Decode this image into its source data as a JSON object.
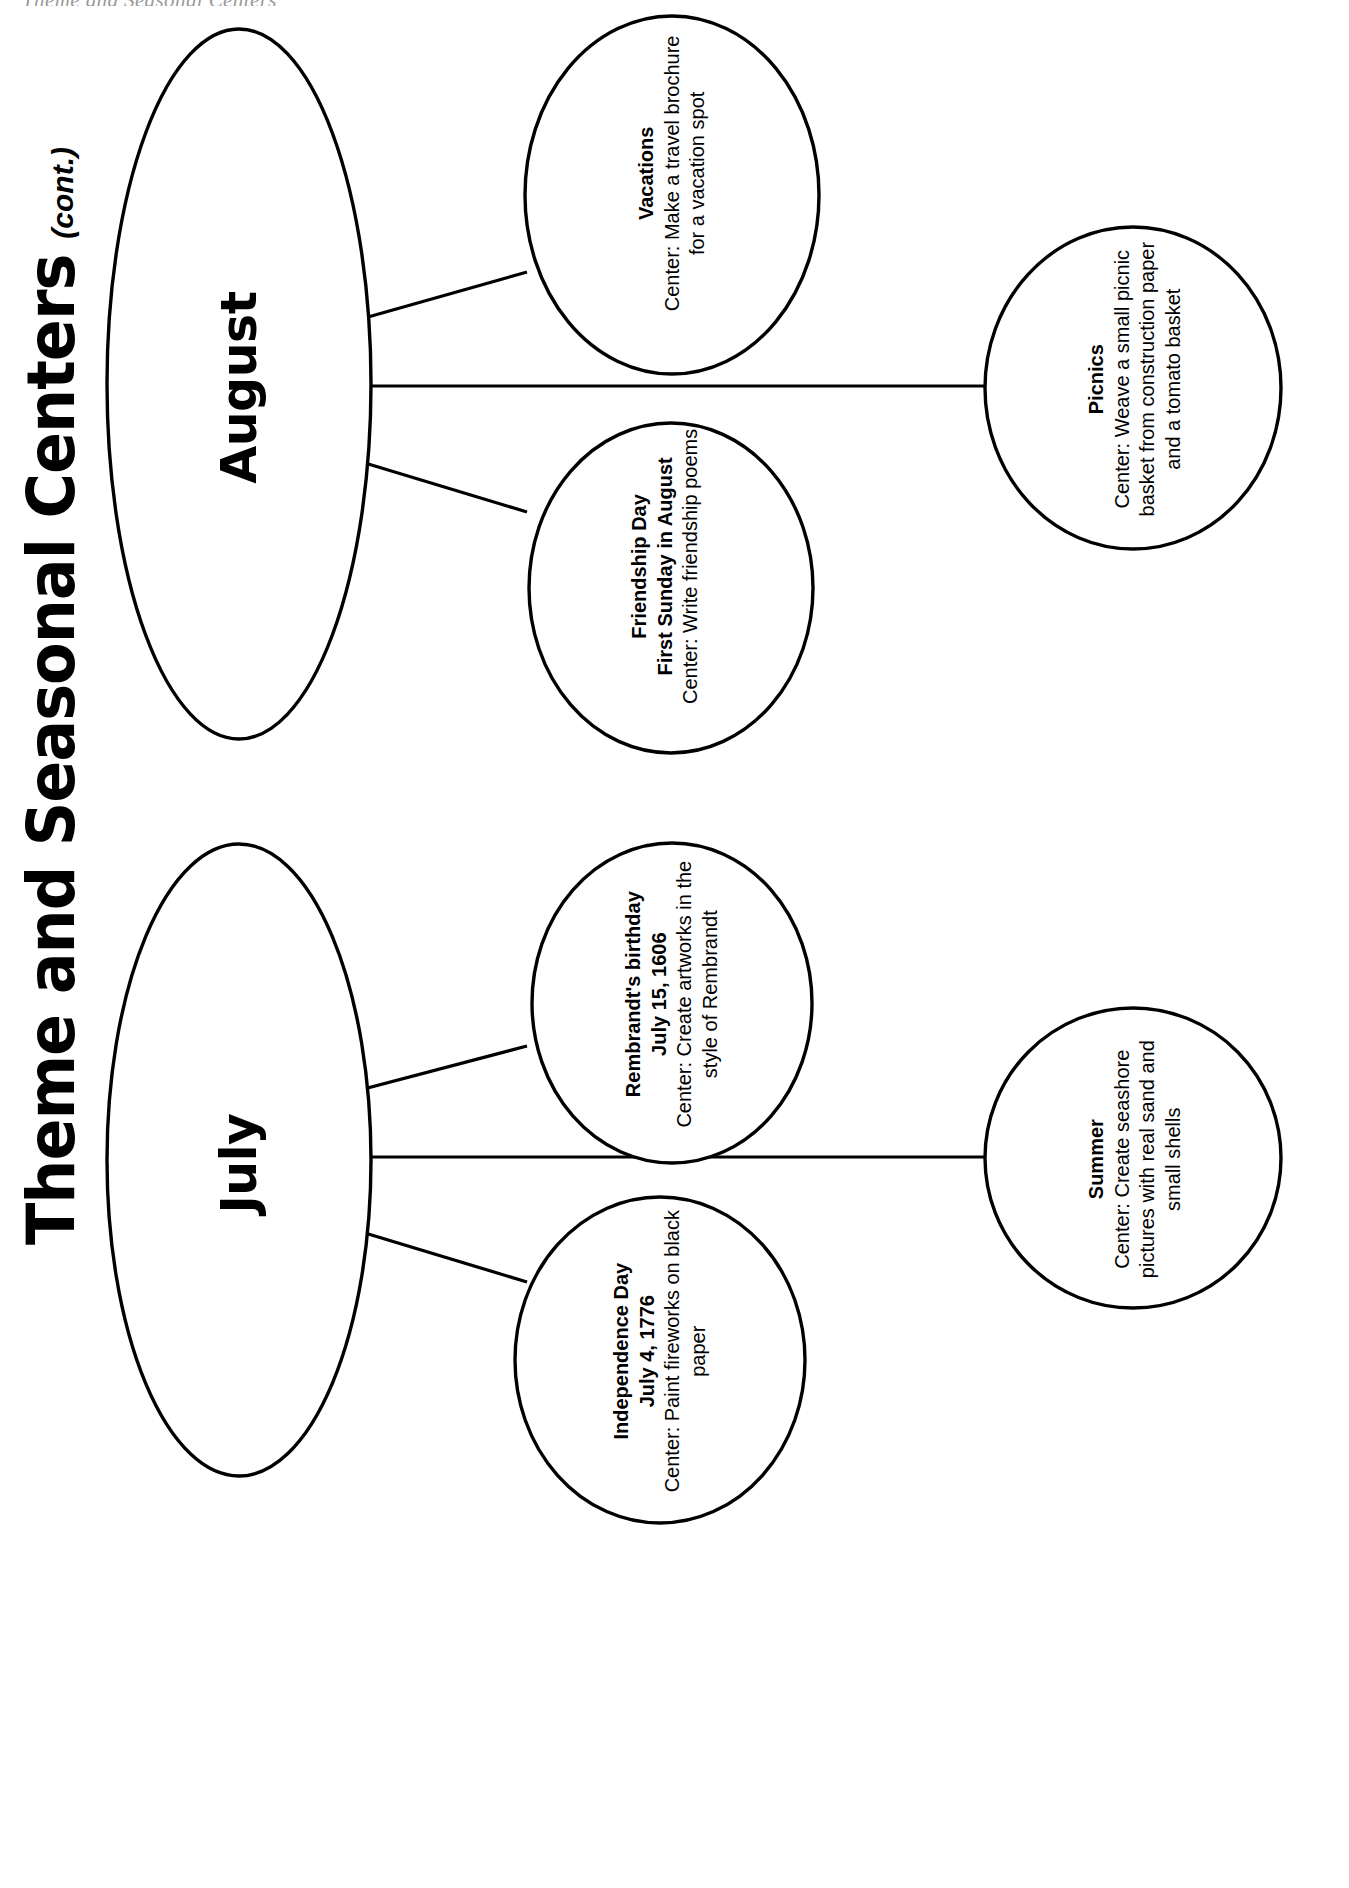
{
  "running_header": "Theme and Seasonal Centers",
  "title": {
    "main": "Theme and Seasonal Centers",
    "suffix": "(cont.)"
  },
  "diagram": {
    "type": "mind-map",
    "orientation": "rotated-90-ccw",
    "branches": [
      {
        "month": "August",
        "nodes": [
          {
            "name": "vacations",
            "title": "Vacations",
            "body": "Center: Make a travel brochure for a vacation spot"
          },
          {
            "name": "friendship-day",
            "title": "Friendship Day\nFirst Sunday in August",
            "title_line1": "Friendship Day",
            "title_line2": "First Sunday in August",
            "body": "Center: Write friendship poems"
          },
          {
            "name": "picnics",
            "title": "Picnics",
            "body": "Center: Weave a small picnic basket from construction paper and a tomato basket"
          }
        ]
      },
      {
        "month": "July",
        "nodes": [
          {
            "name": "rembrandts-birthday",
            "title": "Rembrandt's birthday\nJuly 15, 1606",
            "title_line1": "Rembrandt's birthday",
            "title_line2": "July 15, 1606",
            "body": "Center: Create artworks in the style of Rembrandt"
          },
          {
            "name": "independence-day",
            "title": "Independence Day\nJuly 4, 1776",
            "title_line1": "Independence Day",
            "title_line2": "July 4, 1776",
            "body": "Center: Paint fireworks on black paper"
          },
          {
            "name": "summer",
            "title": "Summer",
            "body": "Center: Create seashore pictures with real sand and small shells"
          }
        ]
      }
    ]
  },
  "colors": {
    "ink": "#000000",
    "paper": "#ffffff",
    "header_gray": "#9a9a9a"
  }
}
